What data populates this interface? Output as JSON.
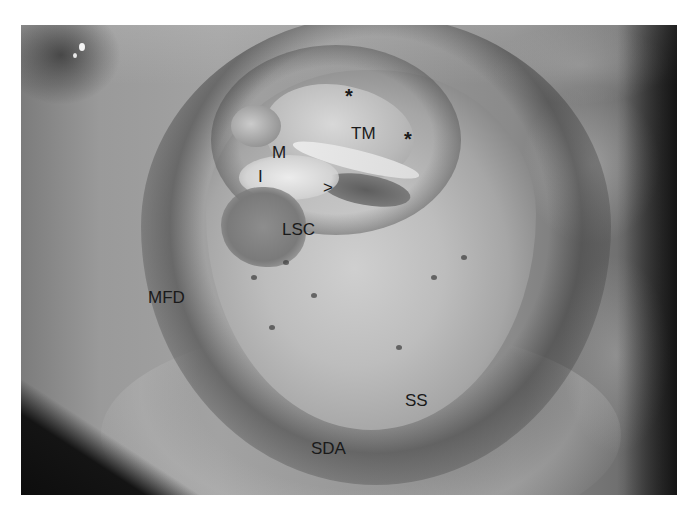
{
  "figure": {
    "labels": [
      {
        "id": "star-1",
        "text": "*",
        "x": 345,
        "y": 86
      },
      {
        "id": "star-2",
        "text": "*",
        "x": 404,
        "y": 129
      },
      {
        "id": "tm",
        "text": "TM",
        "x": 351,
        "y": 125
      },
      {
        "id": "m",
        "text": "M",
        "x": 272,
        "y": 144
      },
      {
        "id": "i",
        "text": "I",
        "x": 258,
        "y": 168
      },
      {
        "id": "arrowhead",
        "text": ">",
        "x": 323,
        "y": 179
      },
      {
        "id": "lsc",
        "text": "LSC",
        "x": 282,
        "y": 221
      },
      {
        "id": "mfd",
        "text": "MFD",
        "x": 148,
        "y": 289
      },
      {
        "id": "ss",
        "text": "SS",
        "x": 405,
        "y": 392
      },
      {
        "id": "sda",
        "text": "SDA",
        "x": 311,
        "y": 440
      }
    ]
  }
}
